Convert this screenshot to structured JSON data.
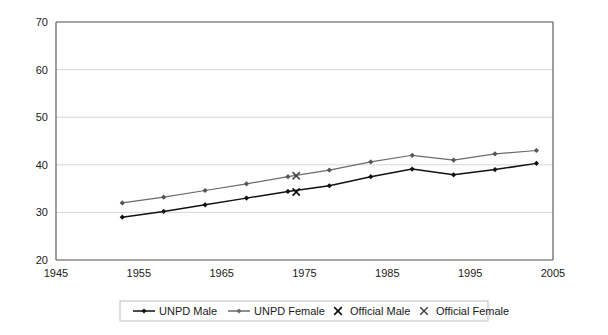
{
  "chart_data": {
    "type": "line",
    "title": "",
    "subtitle": "",
    "xlabel": "",
    "ylabel": "",
    "xlim": [
      1945,
      2005
    ],
    "ylim": [
      20,
      70
    ],
    "grid": true,
    "legend_position": "bottom",
    "x_ticks": [
      "1945",
      "1955",
      "1965",
      "1975",
      "1985",
      "1995",
      "2005"
    ],
    "y_ticks": [
      "20",
      "30",
      "40",
      "50",
      "60",
      "70"
    ],
    "x": [
      1953,
      1958,
      1963,
      1968,
      1973,
      1978,
      1983,
      1988,
      1993,
      1998,
      2003
    ],
    "series": [
      {
        "name": "UNPD Male",
        "marker": "diamond",
        "color": "#111111",
        "values": [
          29.0,
          30.2,
          31.6,
          33.0,
          34.4,
          35.6,
          37.5,
          39.1,
          37.9,
          39.0,
          40.3
        ]
      },
      {
        "name": "UNPD Female",
        "marker": "diamond",
        "color": "#6b6b6b",
        "values": [
          32.0,
          33.2,
          34.6,
          36.0,
          37.5,
          38.9,
          40.6,
          42.0,
          41.0,
          42.3,
          43.0
        ]
      },
      {
        "name": "Official Male",
        "marker": "x",
        "color": "#111111",
        "points": [
          {
            "x": 1974,
            "y": 34.3
          }
        ]
      },
      {
        "name": "Official Female",
        "marker": "x",
        "color": "#444444",
        "points": [
          {
            "x": 1974,
            "y": 37.7
          }
        ]
      }
    ]
  },
  "legend": {
    "items": [
      {
        "label": "UNPD Male",
        "marker": "line-diamond",
        "color": "#111111"
      },
      {
        "label": "UNPD Female",
        "marker": "line-diamond",
        "color": "#6b6b6b"
      },
      {
        "label": "Official Male",
        "marker": "x",
        "color": "#111111"
      },
      {
        "label": "Official Female",
        "marker": "x",
        "color": "#444444"
      }
    ]
  },
  "axis": {
    "y_labels": [
      "70",
      "60",
      "50",
      "40",
      "30",
      "20"
    ],
    "x_labels": [
      "1945",
      "1955",
      "1965",
      "1975",
      "1985",
      "1995",
      "2005"
    ]
  }
}
